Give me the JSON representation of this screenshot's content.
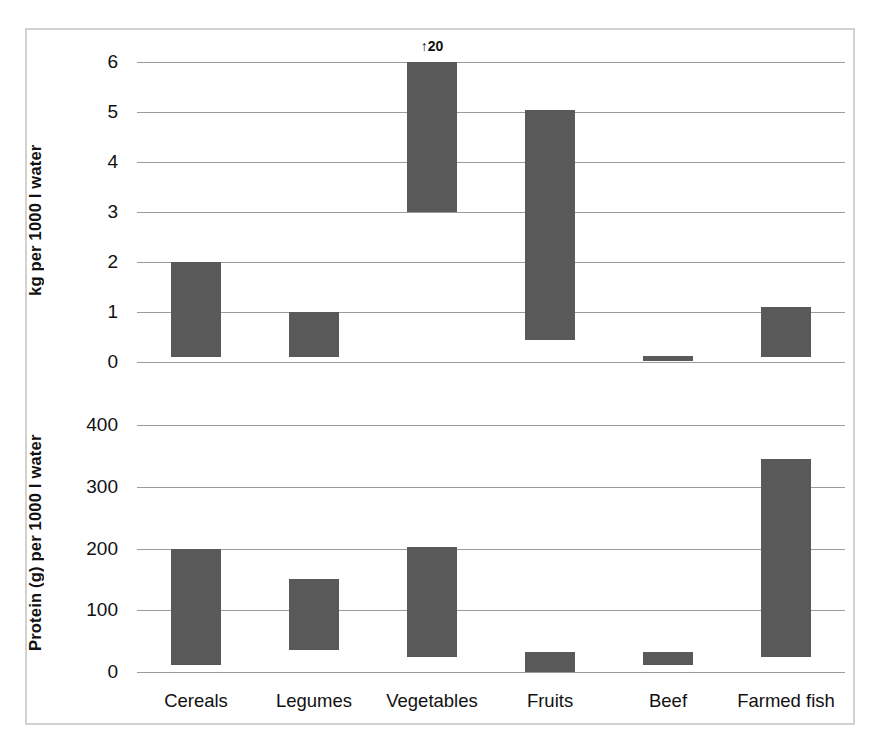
{
  "figure": {
    "background": "#ffffff",
    "frame_color": "#d2d2d2",
    "bar_color": "#595959",
    "grid_color": "#9c9c9c"
  },
  "chart_data": [
    {
      "type": "bar",
      "panel": "top",
      "title": "",
      "xlabel": "",
      "ylabel": "kg per 1000 l water",
      "ylim": [
        0,
        6
      ],
      "yticks": [
        0,
        1,
        2,
        3,
        4,
        5,
        6
      ],
      "ytick_labels": [
        "0",
        "1",
        "2",
        "3",
        "4",
        "5",
        "6"
      ],
      "grid": true,
      "legend": "none",
      "bar_style": "range",
      "categories": [
        "Cereals",
        "Legumes",
        "Vegetables",
        "Fruits",
        "Beef",
        "Farmed fish"
      ],
      "low": [
        0.1,
        0.1,
        3.0,
        0.45,
        0.02,
        0.1
      ],
      "high": [
        2.0,
        1.0,
        6.0,
        5.05,
        0.12,
        1.1
      ],
      "annotations": [
        {
          "category": "Vegetables",
          "text": "↑20",
          "meaning": "bar extends to 20, axis clipped at 6"
        }
      ]
    },
    {
      "type": "bar",
      "panel": "bottom",
      "title": "",
      "xlabel": "",
      "ylabel": "Protein (g) per 1000 l water",
      "ylim": [
        0,
        400
      ],
      "yticks": [
        0,
        100,
        200,
        300,
        400
      ],
      "ytick_labels": [
        "0",
        "100",
        "200",
        "300",
        "400"
      ],
      "grid": true,
      "legend": "none",
      "bar_style": "range",
      "categories": [
        "Cereals",
        "Legumes",
        "Vegetables",
        "Fruits",
        "Beef",
        "Farmed fish"
      ],
      "low": [
        12,
        35,
        25,
        0,
        12,
        25
      ],
      "high": [
        200,
        150,
        202,
        32,
        32,
        345
      ],
      "annotations": []
    }
  ],
  "axes": {
    "top": {
      "ylabel": "kg per 1000 l water",
      "ytick_labels": [
        "6",
        "5",
        "4",
        "3",
        "2",
        "1",
        "0"
      ]
    },
    "bottom": {
      "ylabel": "Protein (g) per 1000 l water",
      "ytick_labels": [
        "400",
        "300",
        "200",
        "100",
        "0"
      ]
    }
  },
  "category_labels": [
    "Cereals",
    "Legumes",
    "Vegetables",
    "Fruits",
    "Beef",
    "Farmed fish"
  ],
  "annotation_top_vegetables": "↑20"
}
